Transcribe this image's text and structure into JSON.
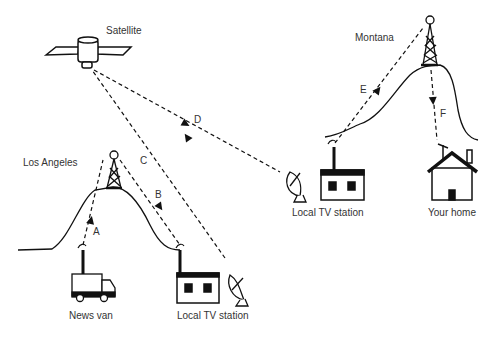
{
  "diagram": {
    "type": "broadcast-signal-path",
    "nodes": {
      "satellite": {
        "label": "Satellite"
      },
      "los_angeles": {
        "label": "Los Angeles"
      },
      "montana": {
        "label": "Montana"
      },
      "news_van": {
        "label": "News van"
      },
      "la_tv_station": {
        "label": "Local TV station"
      },
      "mt_tv_station": {
        "label": "Local TV station"
      },
      "your_home": {
        "label": "Your home"
      }
    },
    "paths": [
      {
        "id": "A",
        "label": "A",
        "from": "News van",
        "to": "Los Angeles tower"
      },
      {
        "id": "B",
        "label": "B",
        "from": "Los Angeles tower",
        "to": "Local TV station (LA)"
      },
      {
        "id": "C",
        "label": "C",
        "from": "Local TV station (LA)",
        "to": "Satellite"
      },
      {
        "id": "D",
        "label": "D",
        "from": "Satellite",
        "to": "Local TV station (Montana)"
      },
      {
        "id": "E",
        "label": "E",
        "from": "Local TV station (Montana)",
        "to": "Montana tower"
      },
      {
        "id": "F",
        "label": "F",
        "from": "Montana tower",
        "to": "Your home"
      }
    ]
  }
}
